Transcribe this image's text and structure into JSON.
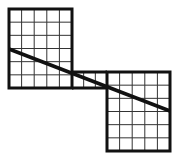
{
  "figure": {
    "colors": {
      "background": "#ffffff",
      "stroke": "#111111",
      "grid": "#333333"
    },
    "left_square": {
      "x": 9,
      "y": 9,
      "width": 63,
      "height": 79,
      "cols": 5,
      "rows": 6
    },
    "connector": {
      "x": 72,
      "y": 72,
      "width": 35,
      "height": 16,
      "cols": 3,
      "rows": 1
    },
    "right_square": {
      "x": 107,
      "y": 72,
      "width": 63,
      "height": 79,
      "cols": 5,
      "rows": 6
    },
    "diagonal_line": {
      "x1": 9,
      "y1": 49,
      "x2": 170,
      "y2": 111
    }
  }
}
